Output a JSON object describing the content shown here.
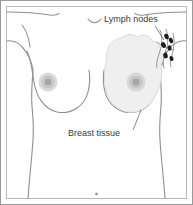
{
  "figure": {
    "kind": "medical-illustration",
    "background_color": "#ffffff",
    "frame": {
      "outer_border_color": "#9a9a9a",
      "inner_border_color": "#b5b5b5"
    },
    "line_color": "#8f8f8f",
    "anatomy": {
      "body_outline_color": "#8f8f8f",
      "breast_tissue_fill": "#efefef",
      "breast_tissue_stroke": "#d8d8d8",
      "areola_outer_color": "#cfcfcf",
      "areola_inner_color": "#b3b3b3",
      "nipple_color": "#9e9e9e",
      "lymph_node_color": "#1c1c1c",
      "lymph_vessel_color": "#8f8f8f",
      "navel_color": "#8f8f8f"
    },
    "labels": [
      {
        "id": "lymph-nodes",
        "text": "Lymph nodes",
        "x": 100,
        "y": 22,
        "anchor": "start",
        "leader_from": [
          155,
          26
        ],
        "leader_to": [
          164,
          40
        ]
      },
      {
        "id": "breast-tissue",
        "text": "Breast tissue",
        "x": 68,
        "y": 136,
        "anchor": "start",
        "leader_from": [
          133,
          130
        ],
        "leader_to": [
          141,
          110
        ]
      }
    ],
    "lymph_nodes": [
      {
        "cx": 166.5,
        "cy": 36.5,
        "rx": 2.1,
        "ry": 2.9,
        "rot": -22
      },
      {
        "cx": 171.0,
        "cy": 40.5,
        "rx": 2.0,
        "ry": 2.8,
        "rot": -18
      },
      {
        "cx": 163.5,
        "cy": 45.0,
        "rx": 2.2,
        "ry": 3.0,
        "rot": -25
      },
      {
        "cx": 169.5,
        "cy": 48.0,
        "rx": 2.0,
        "ry": 2.7,
        "rot": -20
      },
      {
        "cx": 165.5,
        "cy": 55.5,
        "rx": 2.2,
        "ry": 2.9,
        "rot": -15
      },
      {
        "cx": 171.5,
        "cy": 58.5,
        "rx": 1.9,
        "ry": 2.6,
        "rot": -20
      }
    ],
    "breasts": [
      {
        "side": "left",
        "nipple_cx": 48,
        "nipple_cy": 82,
        "shaded": false
      },
      {
        "side": "right",
        "nipple_cx": 136,
        "nipple_cy": 82,
        "shaded": true
      }
    ]
  }
}
